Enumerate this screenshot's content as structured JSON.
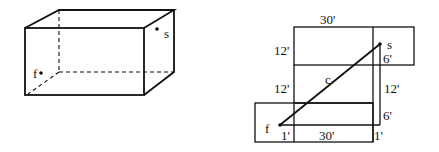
{
  "box3d": {
    "points": {
      "s": {
        "label": "s"
      },
      "f": {
        "label": "f"
      }
    }
  },
  "net": {
    "dimensions": {
      "top_length": "30'",
      "left_height_upper": "12'",
      "left_height_middle": "12'",
      "right_offset_top": "6'",
      "right_height": "12'",
      "right_offset_bottom": "6'",
      "bottom_left_offset": "1'",
      "bottom_length": "30'",
      "bottom_right_offset": "1'"
    },
    "points": {
      "s": {
        "label": "s"
      },
      "f": {
        "label": "f"
      }
    },
    "path_label": "c"
  },
  "colors": {
    "stroke": "#111111",
    "background": "#ffffff"
  }
}
